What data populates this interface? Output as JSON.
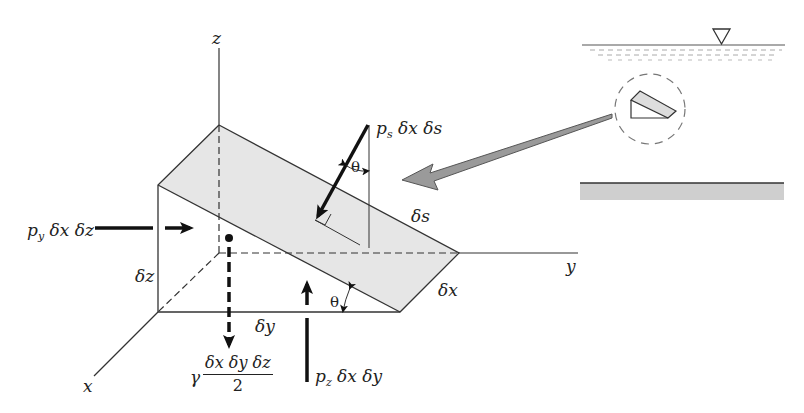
{
  "figure": {
    "axes": {
      "x": "x",
      "y": "y",
      "z": "z"
    },
    "dimensions": {
      "dx": "δx",
      "dy": "δy",
      "dz": "δz",
      "ds": "δs"
    },
    "angles": {
      "theta_top": "θ",
      "theta_bottom": "θ"
    },
    "forces": {
      "ps": {
        "symbol": "p",
        "subscript": "s",
        "rest": " δx δs"
      },
      "py": {
        "symbol": "p",
        "subscript": "y",
        "rest": " δx δz"
      },
      "pz": {
        "symbol": "p",
        "subscript": "z",
        "rest": " δx δy"
      },
      "weight": {
        "prefix": "γ",
        "numerator": "δx δy δz",
        "denominator": "2"
      }
    },
    "inset": {
      "free_surface_symbol": "▽",
      "description": "wedge-shaped fluid element within fluid body between free surface and bottom"
    },
    "colors": {
      "shade": "#e6e6e6",
      "line": "#333333",
      "pointer": "#9a9a9a",
      "bottom": "#cfcfcf"
    }
  }
}
